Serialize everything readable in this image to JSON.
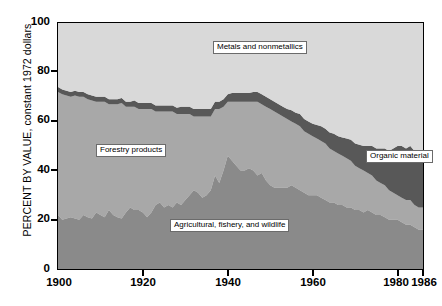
{
  "axes": {
    "y_title": "PERCENT BY VALUE, constant 1972 dollars",
    "y_ticks": [
      "100",
      "80",
      "60",
      "40",
      "20",
      "0"
    ],
    "x_ticks": [
      "1900",
      "1920",
      "1940",
      "1960",
      "1980",
      "1986"
    ]
  },
  "labels": {
    "metals": "Metals and nonmetallics",
    "forestry": "Forestry products",
    "agricultural": "Agricultural, fishery, and wildlife",
    "organic": "Organic material"
  },
  "colors": {
    "metals": "#d9d9d9",
    "organic": "#585858",
    "forestry": "#a8a8a8",
    "agricultural": "#8a8a8a",
    "axis": "#000000",
    "plot_border": "#000000"
  },
  "chart_data": {
    "type": "area",
    "title": "",
    "xlabel": "",
    "ylabel": "PERCENT BY VALUE, constant 1972 dollars",
    "xlim": [
      1900,
      1986
    ],
    "ylim": [
      0,
      100
    ],
    "grid": false,
    "legend": "inline-callouts",
    "stacked": true,
    "stack_order_bottom_to_top": [
      "Agricultural, fishery, and wildlife",
      "Forestry products",
      "Organic material",
      "Metals and nonmetallics"
    ],
    "x": [
      1900,
      1901,
      1902,
      1903,
      1904,
      1905,
      1906,
      1907,
      1908,
      1909,
      1910,
      1911,
      1912,
      1913,
      1914,
      1915,
      1916,
      1917,
      1918,
      1919,
      1920,
      1921,
      1922,
      1923,
      1924,
      1925,
      1926,
      1927,
      1928,
      1929,
      1930,
      1931,
      1932,
      1933,
      1934,
      1935,
      1936,
      1937,
      1938,
      1939,
      1940,
      1941,
      1942,
      1943,
      1944,
      1945,
      1946,
      1947,
      1948,
      1949,
      1950,
      1951,
      1952,
      1953,
      1954,
      1955,
      1956,
      1957,
      1958,
      1959,
      1960,
      1961,
      1962,
      1963,
      1964,
      1965,
      1966,
      1967,
      1968,
      1969,
      1970,
      1971,
      1972,
      1973,
      1974,
      1975,
      1976,
      1977,
      1978,
      1979,
      1980,
      1981,
      1982,
      1983,
      1984,
      1985,
      1986
    ],
    "series": [
      {
        "name": "Agricultural, fishery, and wildlife",
        "values": [
          22,
          20,
          20.5,
          21,
          20.5,
          20,
          22,
          21,
          20.5,
          23,
          22,
          21,
          24,
          22,
          21,
          20.5,
          23,
          25,
          24,
          24,
          23,
          21,
          23,
          26,
          27,
          25,
          26,
          25,
          27,
          26,
          28,
          30,
          32,
          31,
          29,
          30,
          32,
          38,
          35,
          40,
          46,
          44,
          42,
          40,
          40,
          41,
          40,
          38,
          39,
          36,
          34,
          33,
          33,
          33,
          33,
          34,
          33,
          32,
          31,
          30,
          30,
          30,
          29,
          28,
          27,
          27,
          26,
          26,
          25,
          25,
          24,
          24,
          23,
          24,
          23,
          22,
          22,
          21,
          20,
          20,
          20,
          19,
          18,
          18,
          17,
          16,
          16
        ]
      },
      {
        "name": "Forestry products",
        "values": [
          50,
          51,
          50,
          49,
          50,
          50,
          48,
          48,
          48,
          45,
          46,
          47,
          43,
          45,
          46,
          47,
          43,
          41,
          42,
          41,
          42,
          44,
          42,
          38,
          37,
          39,
          38,
          39,
          36,
          37,
          35,
          33,
          30,
          31,
          33,
          32,
          30,
          27,
          30,
          26,
          22,
          24,
          26,
          28,
          28,
          27,
          28,
          30,
          28,
          30,
          31,
          31,
          30,
          29,
          28,
          26,
          26,
          26,
          25,
          25,
          24,
          23,
          23,
          23,
          22,
          21,
          21,
          20,
          20,
          19,
          18,
          17,
          17,
          15,
          15,
          14,
          13,
          13,
          12,
          11,
          10,
          10,
          10,
          10,
          9,
          9,
          9
        ]
      },
      {
        "name": "Organic material",
        "values": [
          2,
          2,
          2,
          2,
          2,
          2,
          2,
          2,
          2,
          2,
          2,
          2,
          2,
          2,
          2,
          2,
          2,
          2,
          2.5,
          2.5,
          2.5,
          2.5,
          2.5,
          2.5,
          2.5,
          2.5,
          2.5,
          2.5,
          2.5,
          3,
          3,
          3,
          3,
          3,
          3,
          3,
          3,
          3,
          3,
          3,
          3,
          3.5,
          3.5,
          3.5,
          3.5,
          3.5,
          4,
          4,
          4,
          4,
          4,
          4,
          4,
          4,
          4,
          4.5,
          4.5,
          5,
          5,
          5,
          5,
          5.5,
          6,
          6,
          6.5,
          7,
          7,
          7.5,
          8,
          8.5,
          9,
          9.5,
          10,
          11,
          12,
          13,
          14,
          15,
          16,
          18,
          20,
          21,
          21,
          22,
          22,
          23,
          23
        ]
      },
      {
        "name": "Metals and nonmetallics",
        "values": [
          26,
          27,
          27.5,
          28,
          27.5,
          28,
          28,
          29,
          29.5,
          30,
          30,
          30,
          31,
          31,
          31,
          30.5,
          32,
          32,
          31.5,
          32.5,
          32.5,
          32.5,
          32.5,
          33.5,
          33.5,
          33.5,
          33.5,
          33.5,
          34.5,
          34,
          34,
          34,
          35,
          35,
          35,
          35,
          35,
          32,
          32,
          31,
          29,
          28.5,
          28.5,
          28.5,
          28.5,
          28.5,
          28,
          28,
          29,
          30,
          31,
          32,
          33,
          34,
          35,
          35.5,
          36.5,
          37,
          39,
          40,
          40.5,
          41,
          42,
          42.5,
          44.5,
          45,
          46,
          46.5,
          46.5,
          47,
          48.5,
          49.5,
          50,
          50,
          50,
          51,
          51,
          51,
          52,
          53,
          50,
          50,
          50,
          49,
          51,
          52,
          52
        ]
      }
    ],
    "notes": {
      "agricultural_peak": {
        "year": 1940,
        "value": 46
      },
      "agricultural_end": {
        "year": 1986,
        "value": 16
      },
      "forestry_start": {
        "year": 1900,
        "value": 50
      },
      "forestry_end": {
        "year": 1986,
        "value": 9
      },
      "organic_end": {
        "year": 1986,
        "value": 23
      },
      "metals_end": {
        "year": 1986,
        "value": 52
      }
    }
  }
}
